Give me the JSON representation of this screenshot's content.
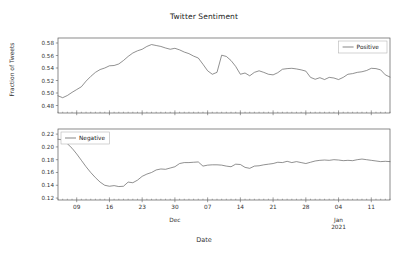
{
  "chart_data": {
    "type": "line",
    "title": "Twitter Sentiment",
    "xlabel": "Date",
    "ylabel": "Fraction of Tweets",
    "grid": false,
    "layout": "two stacked subplots sharing the x axis",
    "x_axis": {
      "tick_labels": [
        "09",
        "16",
        "23",
        "30",
        "07",
        "14",
        "21",
        "28",
        "04",
        "11"
      ],
      "minor_period_labels": [
        "Dec",
        "Jan\n2021"
      ],
      "minor_period_label_1": "Dec",
      "minor_period_label_2a": "Jan",
      "minor_period_label_2b": "2021",
      "range_description": "2020-11-05 to 2021-01-15, daily",
      "xlim": [
        0,
        71
      ]
    },
    "panels": [
      {
        "name": "positive",
        "legend": "Positive",
        "legend_position": "upper right",
        "ylim": [
          0.468,
          0.588
        ],
        "y_ticks": [
          0.48,
          0.5,
          0.52,
          0.54,
          0.56,
          0.58
        ],
        "y_tick_labels": [
          "0.48",
          "0.50",
          "0.52",
          "0.54",
          "0.56",
          "0.58"
        ],
        "series": [
          {
            "name": "Positive",
            "color": "#555555",
            "values": [
              0.4955,
              0.4925,
              0.496,
              0.501,
              0.5055,
              0.51,
              0.519,
              0.5265,
              0.533,
              0.5375,
              0.54,
              0.5435,
              0.544,
              0.5465,
              0.552,
              0.5585,
              0.564,
              0.5675,
              0.57,
              0.5745,
              0.5775,
              0.576,
              0.5745,
              0.572,
              0.57,
              0.5715,
              0.569,
              0.5655,
              0.563,
              0.559,
              0.556,
              0.546,
              0.5355,
              0.53,
              0.533,
              0.5605,
              0.5585,
              0.552,
              0.5425,
              0.53,
              0.532,
              0.5275,
              0.533,
              0.5355,
              0.533,
              0.53,
              0.529,
              0.5325,
              0.538,
              0.539,
              0.5395,
              0.5385,
              0.537,
              0.535,
              0.525,
              0.522,
              0.5245,
              0.5215,
              0.525,
              0.524,
              0.5215,
              0.525,
              0.53,
              0.531,
              0.533,
              0.534,
              0.536,
              0.5395,
              0.539,
              0.537,
              0.529,
              0.5255
            ]
          }
        ]
      },
      {
        "name": "negative",
        "legend": "Negative",
        "legend_position": "upper left",
        "ylim": [
          0.117,
          0.228
        ],
        "y_ticks": [
          0.12,
          0.14,
          0.16,
          0.18,
          0.2,
          0.22
        ],
        "y_tick_labels": [
          "0.12",
          "0.14",
          "0.16",
          "0.18",
          "0.20",
          "0.22"
        ],
        "series": [
          {
            "name": "Negative",
            "color": "#555555",
            "values": [
              0.212,
              0.211,
              0.205,
              0.198,
              0.189,
              0.179,
              0.169,
              0.16,
              0.152,
              0.145,
              0.14,
              0.1385,
              0.1395,
              0.138,
              0.1385,
              0.145,
              0.144,
              0.148,
              0.154,
              0.1575,
              0.16,
              0.164,
              0.1655,
              0.165,
              0.167,
              0.169,
              0.174,
              0.1755,
              0.1755,
              0.176,
              0.1765,
              0.17,
              0.1715,
              0.172,
              0.172,
              0.1715,
              0.17,
              0.169,
              0.173,
              0.1725,
              0.168,
              0.1665,
              0.17,
              0.1705,
              0.172,
              0.173,
              0.174,
              0.176,
              0.1755,
              0.1775,
              0.1755,
              0.177,
              0.1755,
              0.174,
              0.176,
              0.178,
              0.179,
              0.1795,
              0.179,
              0.18,
              0.1795,
              0.1785,
              0.179,
              0.1785,
              0.18,
              0.181,
              0.18,
              0.179,
              0.178,
              0.177,
              0.1775,
              0.177
            ]
          }
        ]
      }
    ]
  }
}
